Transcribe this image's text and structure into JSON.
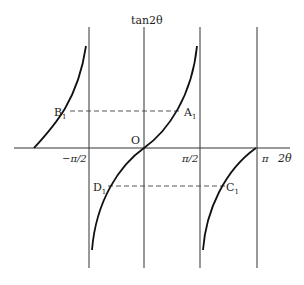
{
  "diagram": {
    "y_axis_label": "tan2θ",
    "x_axis_label": "2θ",
    "origin_label": "O",
    "tick_labels": {
      "neg_half_pi": "−π/2",
      "half_pi": "π/2",
      "pi": "π"
    },
    "points": {
      "A1": "A",
      "B1": "B",
      "C1": "C",
      "D1": "D",
      "subscript": "1"
    },
    "colors": {
      "stroke": "#222222",
      "background": "#ffffff"
    }
  }
}
